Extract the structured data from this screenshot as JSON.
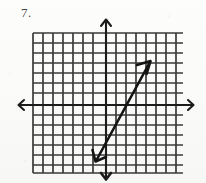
{
  "worksheet": {
    "problem_label": "7.",
    "ink_color": "#1c1c1c",
    "grid_color": "#3a3a3a",
    "background_color": "#fbfbfa"
  },
  "graph": {
    "name": "coordinate-grid-with-line",
    "grid": {
      "columns": 15,
      "rows": 14,
      "cell_size_px": 10,
      "left_px": 33,
      "top_px": 33,
      "right_px": 183,
      "bottom_px": 173
    },
    "origin": {
      "x_px": 106,
      "y_px": 105
    },
    "x_axis": {
      "label": "x-axis",
      "left_arrow": true,
      "right_arrow": true,
      "start_px": 18,
      "end_px": 194,
      "y_px": 105
    },
    "y_axis": {
      "label": "y-axis",
      "up_arrow": true,
      "down_arrow": true,
      "start_px": 19,
      "end_px": 180,
      "x_px": 106
    },
    "drawn_line": {
      "label": "linear-function-graph",
      "double_headed": true,
      "start_point_px": {
        "x": 96,
        "y": 161
      },
      "end_point_px": {
        "x": 150,
        "y": 62
      },
      "slope": 2,
      "y_intercept": -1,
      "equation": "y = 2x - 1"
    }
  }
}
